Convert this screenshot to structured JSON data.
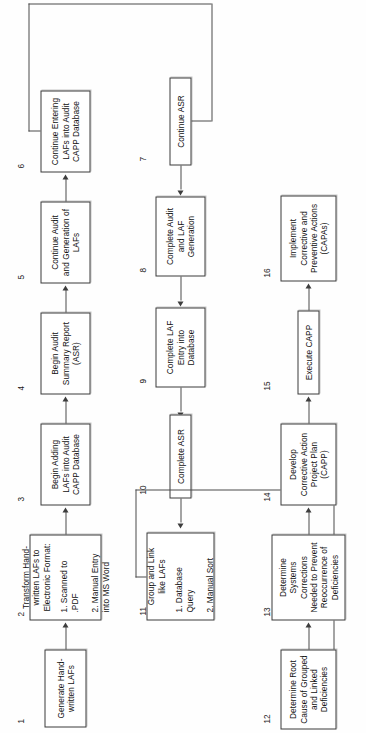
{
  "diagram": {
    "orientation": "rotated-90-ccw",
    "rows": 3,
    "node_count": 16,
    "colors": {
      "box_border": "#3a3a3a",
      "connector": "#4a4a4a",
      "background": "#fefefe",
      "text": "#111111"
    }
  },
  "nodes": [
    {
      "number": "1",
      "title": "Generate Hand-\nwritten LAFs",
      "sublist": ""
    },
    {
      "number": "2",
      "title": "Transform Hand-\nwritten LAFs to\nElectronic Format:",
      "sublist": "1. Scanned to\n    .PDF\n\n2. Manual Entry\n    into MS Word"
    },
    {
      "number": "3",
      "title": "Begin Adding\nLAFs into Audit\nCAPP Database",
      "sublist": ""
    },
    {
      "number": "4",
      "title": "Begin Audit\nSummary Report\n(ASR)",
      "sublist": ""
    },
    {
      "number": "5",
      "title": "Continue Audit\nand Generation of\nLAFs",
      "sublist": ""
    },
    {
      "number": "6",
      "title": "Continue Entering\nLAFs into Audit\nCAPP Database",
      "sublist": ""
    },
    {
      "number": "7",
      "title": "Continue ASR",
      "sublist": ""
    },
    {
      "number": "8",
      "title": "Complete Audit\nand LAF\nGeneration",
      "sublist": ""
    },
    {
      "number": "9",
      "title": "Complete LAF\nEntry into\nDatabase",
      "sublist": ""
    },
    {
      "number": "10",
      "title": "Complete ASR",
      "sublist": ""
    },
    {
      "number": "11",
      "title": "Group and Link\nlike LAFs",
      "sublist": "1. Database\n    Query\n\n2. Manual Sort"
    },
    {
      "number": "12",
      "title": "Determine Root\nCause of Grouped\nand Linked\nDeficiencies",
      "sublist": ""
    },
    {
      "number": "13",
      "title": "Determine\nSystems\nCorrections\nNeeded to Prevent\nReoccurrence of\nDeficiencies",
      "sublist": ""
    },
    {
      "number": "14",
      "title": "Develop\nCorrective Action\nProject Plan\n(CAPP)",
      "sublist": ""
    },
    {
      "number": "15",
      "title": "Execute CAPP",
      "sublist": ""
    },
    {
      "number": "16",
      "title": "Implement\nCorrective and\nPreventive Actions\n(CAPAs)",
      "sublist": ""
    }
  ]
}
